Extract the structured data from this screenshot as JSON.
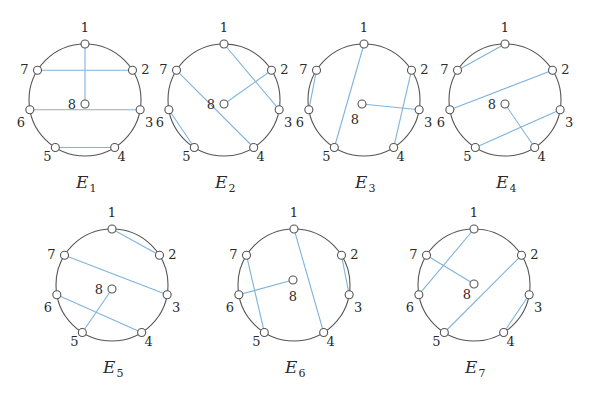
{
  "figure": {
    "node_labels": [
      "1",
      "2",
      "3",
      "4",
      "5",
      "6",
      "7",
      "8"
    ],
    "colors": {
      "edge": "#7fb3dc",
      "rim": "#555555",
      "text": "#2a2a2a"
    },
    "diagrams": [
      {
        "name": "E",
        "sub": "1",
        "cx": 85,
        "cy": 100,
        "edges": [
          [
            1,
            8
          ],
          [
            7,
            2
          ],
          [
            6,
            3
          ],
          [
            5,
            4
          ]
        ],
        "label8": "left"
      },
      {
        "name": "E",
        "sub": "2",
        "cx": 224,
        "cy": 100,
        "edges": [
          [
            1,
            3
          ],
          [
            2,
            8
          ],
          [
            7,
            4
          ],
          [
            6,
            5
          ]
        ],
        "label8": "left"
      },
      {
        "name": "E",
        "sub": "3",
        "cx": 364,
        "cy": 100,
        "edges": [
          [
            1,
            5
          ],
          [
            2,
            4
          ],
          [
            7,
            6
          ],
          [
            8,
            3
          ]
        ],
        "label8": "below-left"
      },
      {
        "name": "E",
        "sub": "4",
        "cx": 505,
        "cy": 100,
        "edges": [
          [
            1,
            7
          ],
          [
            2,
            6
          ],
          [
            3,
            5
          ],
          [
            8,
            4
          ]
        ],
        "label8": "left"
      },
      {
        "name": "E",
        "sub": "5",
        "cx": 112,
        "cy": 285,
        "edges": [
          [
            1,
            2
          ],
          [
            7,
            3
          ],
          [
            6,
            4
          ],
          [
            8,
            5
          ]
        ],
        "label8": "left"
      },
      {
        "name": "E",
        "sub": "6",
        "cx": 294,
        "cy": 285,
        "edges": [
          [
            1,
            4
          ],
          [
            2,
            3
          ],
          [
            7,
            5
          ],
          [
            6,
            8
          ]
        ],
        "label8": "below"
      },
      {
        "name": "E",
        "sub": "7",
        "cx": 474,
        "cy": 285,
        "edges": [
          [
            1,
            6
          ],
          [
            2,
            5
          ],
          [
            3,
            4
          ],
          [
            7,
            8
          ]
        ],
        "label8": "below-left"
      }
    ]
  }
}
